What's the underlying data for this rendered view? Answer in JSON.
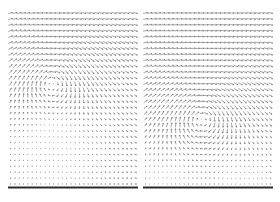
{
  "figure": {
    "background_color": "#ffffff"
  },
  "chart_data": [
    {
      "type": "quiver",
      "panel": "left",
      "title": "",
      "xlabel": "",
      "ylabel": "",
      "grid": {
        "cols": 30,
        "rows": 30
      },
      "flow_model": {
        "uniform_u": 1.0,
        "vortex": {
          "cx": 0.333,
          "cy": 0.38,
          "core_radius": 0.145,
          "strength": 2.4,
          "rotation_on_screen": "clockwise",
          "wall_image_vortex": true
        }
      },
      "axes": {
        "bottom_axis_line": true,
        "ticks": false,
        "tick_labels": false,
        "grid_lines": false,
        "legend": false
      },
      "style": {
        "arrow_color": "#757575",
        "arrow_stroke_width": 0.65,
        "axis_line_color": "#2b2b2b",
        "axis_line_width": 2
      }
    },
    {
      "type": "quiver",
      "panel": "right",
      "title": "",
      "xlabel": "",
      "ylabel": "",
      "grid": {
        "cols": 30,
        "rows": 30
      },
      "flow_model": {
        "uniform_u": 1.0,
        "vortex": {
          "cx": 0.455,
          "cy": 0.595,
          "core_radius": 0.15,
          "strength": 2.5,
          "rotation_on_screen": "clockwise",
          "wall_image_vortex": true
        }
      },
      "axes": {
        "bottom_axis_line": true,
        "ticks": false,
        "tick_labels": false,
        "grid_lines": false,
        "legend": false
      },
      "style": {
        "arrow_color": "#757575",
        "arrow_stroke_width": 0.65,
        "axis_line_color": "#2b2b2b",
        "axis_line_width": 2
      }
    }
  ]
}
